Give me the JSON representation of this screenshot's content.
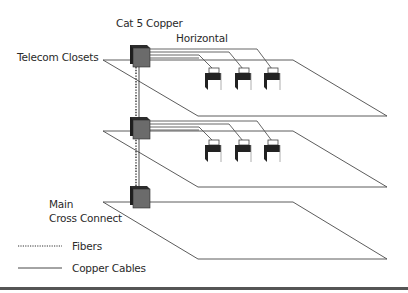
{
  "labels": {
    "cat5": "Cat 5 Copper",
    "horizontal": "Horizontal",
    "telecom_closets": "Telecom Closets",
    "main_line1": "Main",
    "main_line2": "Cross Connect"
  },
  "legend": {
    "fibers": "Fibers",
    "copper": "Copper Cables"
  },
  "colors": {
    "plane_stroke": "#4a4a4a",
    "box_front": "#6b6b6b",
    "box_back": "#1e1e1e",
    "cable": "#555555",
    "rule": "#555555"
  },
  "floors": [
    {
      "name": "floor-3",
      "plane_top_y": 60,
      "box_y": 45,
      "outlets": 3
    },
    {
      "name": "floor-2",
      "plane_top_y": 131,
      "box_y": 117,
      "outlets": 3
    },
    {
      "name": "floor-1-main-cross-connect",
      "plane_top_y": 202,
      "box_y": 186,
      "outlets": 0
    }
  ]
}
